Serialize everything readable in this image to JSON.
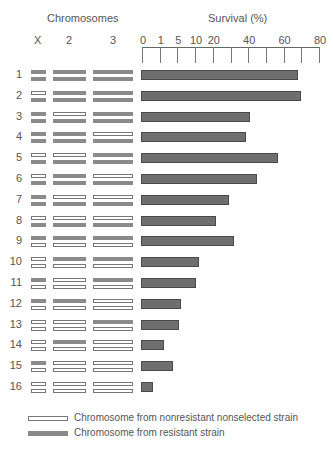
{
  "chart_data": {
    "type": "bar",
    "orientation": "horizontal",
    "title": "",
    "left_panel_title": "Chromosomes",
    "chromosome_columns": [
      "X",
      "2",
      "3"
    ],
    "xlabel": "Survival (%)",
    "ylabel": "",
    "x_ticks": [
      "0",
      "1",
      "5",
      "10",
      "20",
      "40",
      "60",
      "80"
    ],
    "x_tick_positions_note": "non-linear axis: 0,1,5,10,20 evenly spaced, then linear 20-80 with minor ticks at 30,50,70",
    "xlim": [
      0,
      80
    ],
    "grid": false,
    "categories": [
      "1",
      "2",
      "3",
      "4",
      "5",
      "6",
      "7",
      "8",
      "9",
      "10",
      "11",
      "12",
      "13",
      "14",
      "15",
      "16"
    ],
    "values": [
      68,
      70,
      41,
      39,
      57,
      45,
      29,
      22,
      32,
      12,
      10.5,
      6,
      5.5,
      2,
      4,
      0.6
    ],
    "genotypes": [
      {
        "X": [
          "R",
          "R"
        ],
        "2": [
          "R",
          "R"
        ],
        "3": [
          "R",
          "R"
        ]
      },
      {
        "X": [
          "N",
          "R"
        ],
        "2": [
          "R",
          "R"
        ],
        "3": [
          "R",
          "R"
        ]
      },
      {
        "X": [
          "R",
          "R"
        ],
        "2": [
          "N",
          "R"
        ],
        "3": [
          "R",
          "R"
        ]
      },
      {
        "X": [
          "R",
          "R"
        ],
        "2": [
          "R",
          "R"
        ],
        "3": [
          "N",
          "R"
        ]
      },
      {
        "X": [
          "N",
          "R"
        ],
        "2": [
          "N",
          "R"
        ],
        "3": [
          "R",
          "R"
        ]
      },
      {
        "X": [
          "N",
          "R"
        ],
        "2": [
          "R",
          "R"
        ],
        "3": [
          "N",
          "R"
        ]
      },
      {
        "X": [
          "R",
          "R"
        ],
        "2": [
          "N",
          "R"
        ],
        "3": [
          "N",
          "R"
        ]
      },
      {
        "X": [
          "N",
          "R"
        ],
        "2": [
          "N",
          "R"
        ],
        "3": [
          "N",
          "R"
        ]
      },
      {
        "X": [
          "R",
          "N"
        ],
        "2": [
          "R",
          "N"
        ],
        "3": [
          "R",
          "N"
        ]
      },
      {
        "X": [
          "N",
          "N"
        ],
        "2": [
          "R",
          "N"
        ],
        "3": [
          "R",
          "N"
        ]
      },
      {
        "X": [
          "R",
          "N"
        ],
        "2": [
          "N",
          "N"
        ],
        "3": [
          "R",
          "N"
        ]
      },
      {
        "X": [
          "R",
          "N"
        ],
        "2": [
          "R",
          "N"
        ],
        "3": [
          "N",
          "N"
        ]
      },
      {
        "X": [
          "N",
          "N"
        ],
        "2": [
          "N",
          "N"
        ],
        "3": [
          "R",
          "N"
        ]
      },
      {
        "X": [
          "N",
          "N"
        ],
        "2": [
          "R",
          "N"
        ],
        "3": [
          "N",
          "N"
        ]
      },
      {
        "X": [
          "R",
          "N"
        ],
        "2": [
          "N",
          "N"
        ],
        "3": [
          "N",
          "N"
        ]
      },
      {
        "X": [
          "N",
          "N"
        ],
        "2": [
          "N",
          "N"
        ],
        "3": [
          "N",
          "N"
        ]
      }
    ],
    "legend": [
      {
        "key": "N",
        "style": "open bar",
        "label": "Chromosome from nonresistant nonselected strain"
      },
      {
        "key": "R",
        "style": "filled gray bar",
        "label": "Chromosome from resistant strain"
      }
    ],
    "colors": {
      "filled_chromosome": "#8a8a8a",
      "survival_bar": "#6e6e6e",
      "outline": "#777777"
    }
  }
}
